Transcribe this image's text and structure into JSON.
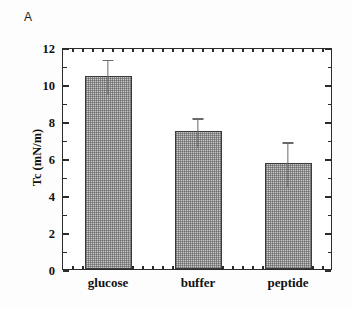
{
  "panel": {
    "label": "A"
  },
  "chart_data": {
    "type": "bar",
    "title": "",
    "subtitle": "",
    "xlabel": "",
    "ylabel": "Tc (mN/m)",
    "categories": [
      "glucose",
      "buffer",
      "peptide"
    ],
    "values": [
      10.45,
      7.45,
      5.75
    ],
    "errors_upper": [
      11.4,
      8.25,
      6.95
    ],
    "errors_lower": [
      9.5,
      6.65,
      4.55
    ],
    "error_plus": [
      0.95,
      0.8,
      1.2
    ],
    "error_minus": [
      0.95,
      0.8,
      1.2
    ],
    "ylim": [
      0,
      12
    ],
    "yticks": [
      0,
      2,
      4,
      6,
      8,
      10,
      12
    ],
    "ytick_labels": [
      "0",
      "2",
      "4",
      "6",
      "8",
      "10",
      "12"
    ],
    "y_minor_step": 1,
    "grid": false,
    "legend": null,
    "legend_position": "none",
    "bar_fill": "#c9c9c9",
    "bar_pattern": "crosshatch-dither",
    "bar_edge_color": "#3a3a3a",
    "error_color": "#6a6a6a",
    "axis_color": "#2b2b2b",
    "frame": "box"
  },
  "colors": {
    "background": "#ffffff",
    "axis": "#2b2b2b",
    "bar": "#c9c9c9",
    "error": "#6a6a6a",
    "text": "#111111"
  }
}
